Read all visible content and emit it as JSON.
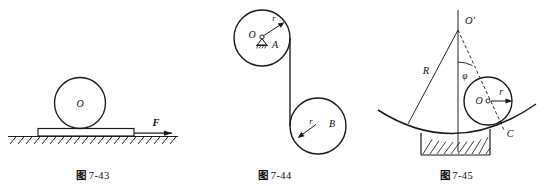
{
  "page": {
    "width": 549,
    "height": 186,
    "background": "#ffffff",
    "ink_color": "#1a1a1a"
  },
  "figures": [
    {
      "id": "fig-7-43",
      "caption_cjk": "图",
      "caption_number": "7-43",
      "caption_full": "图 7-43",
      "description": "A cylinder resting on a plank on hatched ground, plank pulled by force F",
      "labels": [
        {
          "name": "cylinder-center-label",
          "text": "O",
          "italic": true
        },
        {
          "name": "force-label",
          "text": "F",
          "italic": true
        }
      ],
      "elements": [
        "circle-cylinder",
        "plank-rectangle",
        "ground-line",
        "ground-hatching",
        "force-arrow"
      ]
    },
    {
      "id": "fig-7-44",
      "caption_cjk": "图",
      "caption_number": "7-44",
      "caption_full": "图 7-44",
      "description": "Upper pulley A on a fixed pivot at O connected by a cord to a lower free pulley B",
      "labels": [
        {
          "name": "pulley-a-center-label",
          "text": "O",
          "italic": true
        },
        {
          "name": "pulley-a-label",
          "text": "A",
          "italic": true
        },
        {
          "name": "pulley-a-radius-label",
          "text": "r",
          "italic": true
        },
        {
          "name": "pulley-b-label",
          "text": "B",
          "italic": true
        },
        {
          "name": "pulley-b-radius-label",
          "text": "r",
          "italic": true
        }
      ],
      "elements": [
        "circle-pulley-a",
        "circle-pulley-b",
        "fixed-pivot-support",
        "cord-line",
        "radius-arrow-a",
        "radius-arrow-b"
      ]
    },
    {
      "id": "fig-7-45",
      "caption_cjk": "图",
      "caption_number": "7-45",
      "caption_full": "图 7-45",
      "description": "A cylinder of radius r rolling inside a concave surface of radius R, displaced by angle phi from vertical, contact point C",
      "labels": [
        {
          "name": "center-of-curvature-label",
          "text": "O'",
          "italic": true
        },
        {
          "name": "curvature-radius-label",
          "text": "R",
          "italic": true
        },
        {
          "name": "angle-label",
          "text": "φ",
          "italic": true
        },
        {
          "name": "cylinder-center-label",
          "text": "O",
          "italic": true
        },
        {
          "name": "cylinder-radius-label",
          "text": "r",
          "italic": true
        },
        {
          "name": "contact-point-label",
          "text": "C",
          "italic": true
        }
      ],
      "elements": [
        "concave-arc",
        "ground-hatching",
        "vertical-axis-line",
        "radius-line-R",
        "dashed-center-line",
        "angle-arc",
        "circle-cylinder",
        "radius-arrow-r"
      ]
    }
  ]
}
